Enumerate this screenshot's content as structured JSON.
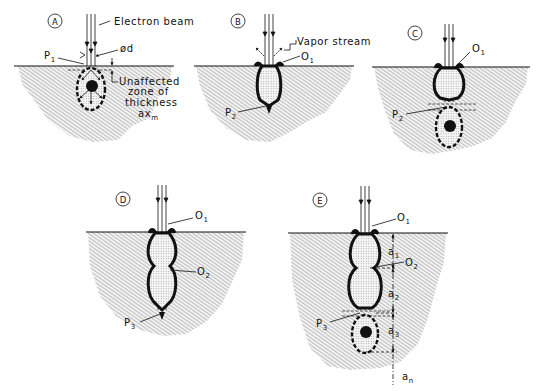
{
  "diagram": {
    "panels": [
      {
        "id": "A",
        "labels": {
          "beam": "Electron beam",
          "point": "P",
          "point_sub": "1",
          "diameter": "ød",
          "zone_l1": "Unaffected",
          "zone_l2": "zone of",
          "zone_l3": "thickness",
          "zone_l4": "ax",
          "zone_l4_sub": "m"
        }
      },
      {
        "id": "B",
        "labels": {
          "vapor": "Vapor stream",
          "opening": "O",
          "opening_sub": "1",
          "point": "P",
          "point_sub": "2"
        }
      },
      {
        "id": "C",
        "labels": {
          "opening": "O",
          "opening_sub": "1",
          "point": "P",
          "point_sub": "2"
        }
      },
      {
        "id": "D",
        "labels": {
          "opening1": "O",
          "opening1_sub": "1",
          "opening2": "O",
          "opening2_sub": "2",
          "point": "P",
          "point_sub": "3"
        }
      },
      {
        "id": "E",
        "labels": {
          "opening1": "O",
          "opening1_sub": "1",
          "opening2": "O",
          "opening2_sub": "2",
          "point": "P",
          "point_sub": "3",
          "a1": "a",
          "a1_sub": "1",
          "a2": "a",
          "a2_sub": "2",
          "a3": "a",
          "a3_sub": "3",
          "an": "a",
          "an_sub": "n"
        }
      }
    ]
  }
}
